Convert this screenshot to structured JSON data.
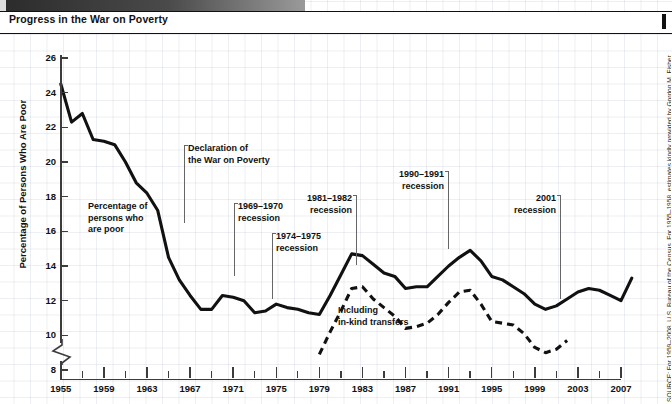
{
  "window": {
    "title": "Progress in the War on Poverty",
    "tab_label": ""
  },
  "source_note": "SOURCE: For 1959–2008, U.S. Bureau of the Census. For 1955–1958, estimates kindly provided by Gordon M. Fisher.",
  "annotations": [
    {
      "id": "series-label-poor",
      "text": "Percentage of\npersons who\nare poor",
      "x": 88,
      "y": 168,
      "align": "left",
      "leader": null
    },
    {
      "id": "declaration",
      "text": "Declaration of\nthe War on Poverty",
      "x": 188,
      "y": 110,
      "align": "left",
      "leader": {
        "x": 184,
        "y1": 112,
        "y2": 190,
        "cap": "top-left"
      }
    },
    {
      "id": "recession-1969",
      "text": "1969–1970\nrecession",
      "x": 238,
      "y": 168,
      "align": "left",
      "leader": {
        "x": 234,
        "y1": 170,
        "y2": 243,
        "cap": "top-left"
      }
    },
    {
      "id": "recession-1974",
      "text": "1974–1975\nrecession",
      "x": 276,
      "y": 198,
      "align": "left",
      "leader": {
        "x": 272,
        "y1": 200,
        "y2": 266,
        "cap": "top-left"
      }
    },
    {
      "id": "recession-1981",
      "text": "1981–1982\nrecession",
      "x": 352,
      "y": 160,
      "align": "right",
      "leader": {
        "x": 356,
        "y1": 162,
        "y2": 232,
        "cap": "top-right"
      }
    },
    {
      "id": "recession-1990",
      "text": "1990–1991\nrecession",
      "x": 444,
      "y": 136,
      "align": "right",
      "leader": {
        "x": 448,
        "y1": 138,
        "y2": 216,
        "cap": "top-right"
      }
    },
    {
      "id": "recession-2001",
      "text": "2001\nrecession",
      "x": 556,
      "y": 160,
      "align": "right",
      "leader": {
        "x": 560,
        "y1": 162,
        "y2": 266,
        "cap": "top-right"
      }
    },
    {
      "id": "in-kind-transfers",
      "text": "Including\nin-kind transfers",
      "x": 338,
      "y": 272,
      "align": "left",
      "leader": null
    }
  ],
  "chart_data": {
    "type": "line",
    "title": "Progress in the War on Poverty",
    "xlabel": "",
    "ylabel": "Percentage of Persons Who Are Poor",
    "xlim": [
      1955,
      2008
    ],
    "ylim": [
      8,
      26
    ],
    "ytick_step": 2,
    "yticks": [
      8,
      10,
      12,
      14,
      16,
      18,
      20,
      22,
      24,
      26
    ],
    "xticks_major": [
      1955,
      1959,
      1963,
      1967,
      1971,
      1975,
      1979,
      1983,
      1987,
      1991,
      1995,
      1999,
      2003,
      2007
    ],
    "xtick_minor_step": 2,
    "axis_break_below": 8,
    "grid": false,
    "legend": "none",
    "series": [
      {
        "name": "Percentage of persons who are poor",
        "style": "solid",
        "color": "#111111",
        "x": [
          1955,
          1956,
          1957,
          1958,
          1959,
          1960,
          1961,
          1962,
          1963,
          1964,
          1965,
          1966,
          1967,
          1968,
          1969,
          1970,
          1971,
          1972,
          1973,
          1974,
          1975,
          1976,
          1977,
          1978,
          1979,
          1980,
          1981,
          1982,
          1983,
          1984,
          1985,
          1986,
          1987,
          1988,
          1989,
          1990,
          1991,
          1992,
          1993,
          1994,
          1995,
          1996,
          1997,
          1998,
          1999,
          2000,
          2001,
          2002,
          2003,
          2004,
          2005,
          2006,
          2007,
          2008
        ],
        "values": [
          24.5,
          22.3,
          22.8,
          21.3,
          21.2,
          21.0,
          20.0,
          18.8,
          18.2,
          17.2,
          14.5,
          13.2,
          12.3,
          11.5,
          11.5,
          12.3,
          12.2,
          12.0,
          11.3,
          11.4,
          11.8,
          11.6,
          11.5,
          11.3,
          11.2,
          12.3,
          13.5,
          14.7,
          14.6,
          14.1,
          13.6,
          13.4,
          12.7,
          12.8,
          12.8,
          13.4,
          14.0,
          14.5,
          14.9,
          14.3,
          13.4,
          13.2,
          12.8,
          12.4,
          11.8,
          11.5,
          11.7,
          12.1,
          12.5,
          12.7,
          12.6,
          12.3,
          12.0,
          13.3
        ],
        "marker": "none"
      },
      {
        "name": "Including in-kind transfers",
        "style": "dashed",
        "color": "#111111",
        "x": [
          1979,
          1980,
          1981,
          1982,
          1983,
          1984,
          1985,
          1986,
          1987,
          1988,
          1989,
          1990,
          1991,
          1992,
          1993,
          1994,
          1995,
          1996,
          1997,
          1998,
          1999,
          2000,
          2001,
          2002
        ],
        "values": [
          8.9,
          10.2,
          11.4,
          12.7,
          12.8,
          12.1,
          11.6,
          11.1,
          10.4,
          10.5,
          10.7,
          11.2,
          11.9,
          12.5,
          12.6,
          11.8,
          10.8,
          10.7,
          10.6,
          10.1,
          9.3,
          9.0,
          9.2,
          9.7
        ],
        "marker": "none"
      }
    ]
  }
}
